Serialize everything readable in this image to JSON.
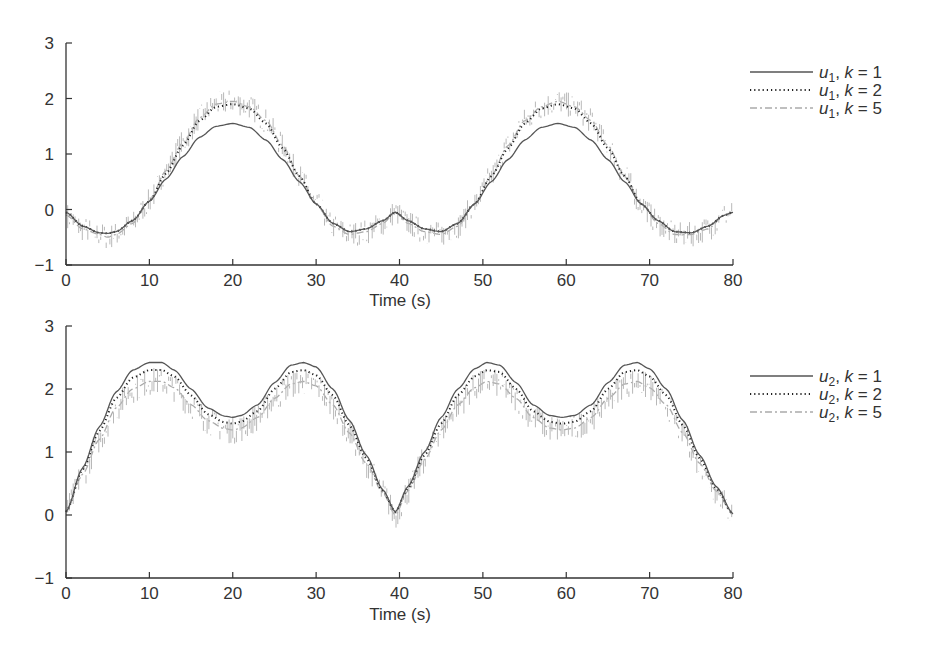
{
  "chart_data": [
    {
      "type": "line",
      "title": "",
      "xlabel": "Time (s)",
      "ylabel": "",
      "xlim": [
        0,
        80
      ],
      "ylim": [
        -1,
        3
      ],
      "xticks": [
        "0",
        "10",
        "20",
        "30",
        "40",
        "50",
        "60",
        "70",
        "80"
      ],
      "yticks": [
        "−1",
        "0",
        "1",
        "2",
        "3"
      ],
      "grid": false,
      "legend_position": "right",
      "x": [
        0,
        2,
        4,
        5,
        6,
        8,
        10,
        12,
        14,
        16,
        18,
        20,
        22,
        24,
        26,
        28,
        30,
        32,
        34,
        36,
        38,
        39.5,
        41,
        43,
        45,
        47,
        49,
        51,
        53,
        55,
        57,
        59,
        61,
        63,
        65,
        67,
        69,
        71,
        73,
        75,
        77,
        79,
        80
      ],
      "series": [
        {
          "name": "u1, k = 1",
          "style": "solid",
          "color": "#555555",
          "values": [
            -0.05,
            -0.3,
            -0.42,
            -0.43,
            -0.4,
            -0.2,
            0.15,
            0.55,
            0.95,
            1.3,
            1.5,
            1.55,
            1.48,
            1.25,
            0.9,
            0.5,
            0.1,
            -0.25,
            -0.4,
            -0.35,
            -0.2,
            -0.05,
            -0.2,
            -0.35,
            -0.4,
            -0.25,
            0.1,
            0.5,
            0.9,
            1.25,
            1.48,
            1.55,
            1.48,
            1.25,
            0.9,
            0.5,
            0.1,
            -0.2,
            -0.4,
            -0.42,
            -0.3,
            -0.1,
            -0.05
          ]
        },
        {
          "name": "u1, k = 2",
          "style": "dotted",
          "color": "#222222",
          "values": [
            -0.05,
            -0.3,
            -0.42,
            -0.43,
            -0.4,
            -0.2,
            0.15,
            0.65,
            1.15,
            1.6,
            1.85,
            1.9,
            1.82,
            1.55,
            1.1,
            0.6,
            0.1,
            -0.25,
            -0.4,
            -0.35,
            -0.2,
            -0.05,
            -0.2,
            -0.35,
            -0.4,
            -0.25,
            0.1,
            0.6,
            1.1,
            1.55,
            1.82,
            1.9,
            1.82,
            1.55,
            1.1,
            0.6,
            0.1,
            -0.2,
            -0.4,
            -0.42,
            -0.3,
            -0.1,
            -0.05
          ]
        },
        {
          "name": "u1, k = 5",
          "style": "dashdot",
          "color": "#aaaaaa",
          "values": [
            -0.1,
            -0.35,
            -0.45,
            -0.5,
            -0.45,
            -0.25,
            0.15,
            0.7,
            1.2,
            1.65,
            1.9,
            1.95,
            1.85,
            1.6,
            1.15,
            0.6,
            0.1,
            -0.3,
            -0.45,
            -0.4,
            -0.25,
            -0.05,
            -0.25,
            -0.4,
            -0.45,
            -0.3,
            0.1,
            0.6,
            1.15,
            1.6,
            1.85,
            1.95,
            1.85,
            1.6,
            1.15,
            0.6,
            0.1,
            -0.25,
            -0.45,
            -0.45,
            -0.35,
            -0.1,
            -0.05
          ]
        }
      ],
      "legend": [
        "u1, k = 1",
        "u1, k = 2",
        "u1, k = 5"
      ]
    },
    {
      "type": "line",
      "title": "",
      "xlabel": "Time (s)",
      "ylabel": "",
      "xlim": [
        0,
        80
      ],
      "ylim": [
        -1,
        3
      ],
      "xticks": [
        "0",
        "10",
        "20",
        "30",
        "40",
        "50",
        "60",
        "70",
        "80"
      ],
      "yticks": [
        "−1",
        "0",
        "1",
        "2",
        "3"
      ],
      "grid": false,
      "legend_position": "right",
      "x": [
        0,
        2,
        4,
        6,
        8,
        10,
        11.5,
        13,
        15,
        17,
        19,
        20,
        21,
        23,
        25,
        27,
        28.5,
        30,
        32,
        34,
        36,
        38,
        39.5,
        41,
        43,
        45,
        47,
        49,
        50.5,
        52,
        54,
        56,
        58,
        59.5,
        61,
        63,
        65,
        67,
        68.5,
        70,
        72,
        74,
        76,
        78,
        80
      ],
      "series": [
        {
          "name": "u2, k = 1",
          "style": "solid",
          "color": "#555555",
          "values": [
            0.05,
            0.75,
            1.4,
            1.95,
            2.3,
            2.42,
            2.42,
            2.3,
            2.0,
            1.7,
            1.57,
            1.55,
            1.58,
            1.75,
            2.1,
            2.38,
            2.42,
            2.35,
            2.0,
            1.5,
            0.95,
            0.4,
            0.05,
            0.45,
            1.0,
            1.55,
            2.0,
            2.32,
            2.42,
            2.38,
            2.1,
            1.75,
            1.58,
            1.55,
            1.58,
            1.75,
            2.1,
            2.38,
            2.42,
            2.32,
            2.0,
            1.5,
            0.95,
            0.45,
            0.02
          ]
        },
        {
          "name": "u2, k = 2",
          "style": "dotted",
          "color": "#222222",
          "values": [
            0.05,
            0.72,
            1.33,
            1.85,
            2.18,
            2.3,
            2.3,
            2.2,
            1.9,
            1.6,
            1.47,
            1.45,
            1.48,
            1.65,
            2.0,
            2.27,
            2.3,
            2.22,
            1.9,
            1.42,
            0.9,
            0.38,
            0.05,
            0.42,
            0.95,
            1.45,
            1.9,
            2.2,
            2.3,
            2.27,
            2.0,
            1.65,
            1.48,
            1.45,
            1.48,
            1.65,
            2.0,
            2.27,
            2.3,
            2.2,
            1.9,
            1.42,
            0.9,
            0.42,
            0.02
          ]
        },
        {
          "name": "u2, k = 5",
          "style": "dashdot",
          "color": "#aaaaaa",
          "values": [
            0.05,
            0.65,
            1.2,
            1.7,
            2.0,
            2.12,
            2.12,
            2.02,
            1.75,
            1.5,
            1.37,
            1.35,
            1.38,
            1.55,
            1.85,
            2.08,
            2.12,
            2.05,
            1.75,
            1.3,
            0.82,
            0.35,
            0.0,
            0.38,
            0.88,
            1.35,
            1.75,
            2.02,
            2.12,
            2.08,
            1.85,
            1.55,
            1.38,
            1.35,
            1.38,
            1.55,
            1.85,
            2.08,
            2.12,
            2.02,
            1.75,
            1.3,
            0.82,
            0.38,
            0.0
          ]
        }
      ],
      "legend": [
        "u2, k = 1",
        "u2, k = 2",
        "u2, k = 5"
      ]
    }
  ],
  "panels": [
    {
      "xlabel": "Time (s)",
      "legend": [
        {
          "var": "u",
          "sub": "1",
          "rest": ", ",
          "k": "k",
          "eq": " = 1"
        },
        {
          "var": "u",
          "sub": "1",
          "rest": ", ",
          "k": "k",
          "eq": " = 2"
        },
        {
          "var": "u",
          "sub": "1",
          "rest": ", ",
          "k": "k",
          "eq": " = 5"
        }
      ]
    },
    {
      "xlabel": "Time (s)",
      "legend": [
        {
          "var": "u",
          "sub": "2",
          "rest": ", ",
          "k": "k",
          "eq": " = 1"
        },
        {
          "var": "u",
          "sub": "2",
          "rest": ", ",
          "k": "k",
          "eq": " = 2"
        },
        {
          "var": "u",
          "sub": "2",
          "rest": ", ",
          "k": "k",
          "eq": " = 5"
        }
      ]
    }
  ]
}
